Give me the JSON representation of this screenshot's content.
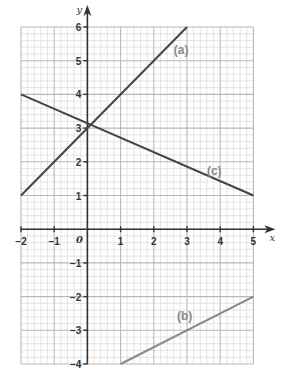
{
  "chart_data": {
    "type": "line",
    "title": "",
    "xlabel": "x",
    "ylabel": "y",
    "xlim": [
      -2,
      5
    ],
    "ylim": [
      -4,
      6
    ],
    "grid": true,
    "minor_grid_step": 0.2,
    "major_grid_step": 1,
    "x_ticks": [
      "−2",
      "−1",
      "0",
      "1",
      "2",
      "3",
      "4",
      "5"
    ],
    "y_ticks": [
      "−4",
      "−3",
      "−2",
      "−1",
      "1",
      "2",
      "3",
      "4",
      "5",
      "6"
    ],
    "origin_label": "0",
    "series": [
      {
        "name": "(a)",
        "equation": "y = x + 3",
        "points": [
          [
            -2,
            1
          ],
          [
            3,
            6
          ]
        ],
        "color": "#444444",
        "label_at": [
          2.6,
          5.2
        ]
      },
      {
        "name": "(b)",
        "equation": "y = 0.5x − 4.5",
        "points": [
          [
            1,
            -4
          ],
          [
            5,
            -2
          ]
        ],
        "color": "#8a8a8a",
        "label_at": [
          2.7,
          -2.7
        ]
      },
      {
        "name": "(c)",
        "equation": "y = −3/7 x + 22/7",
        "points": [
          [
            -2,
            4
          ],
          [
            5,
            1
          ]
        ],
        "color": "#444444",
        "label_at": [
          3.6,
          1.6
        ]
      }
    ]
  },
  "labels": {
    "x_axis": "x",
    "y_axis": "y",
    "origin": "0",
    "line_a": "(a)",
    "line_b": "(b)",
    "line_c": "(c)"
  },
  "colors": {
    "grid_minor": "#d4d4d4",
    "grid_major": "#b8b8b8",
    "axis": "#333333"
  }
}
